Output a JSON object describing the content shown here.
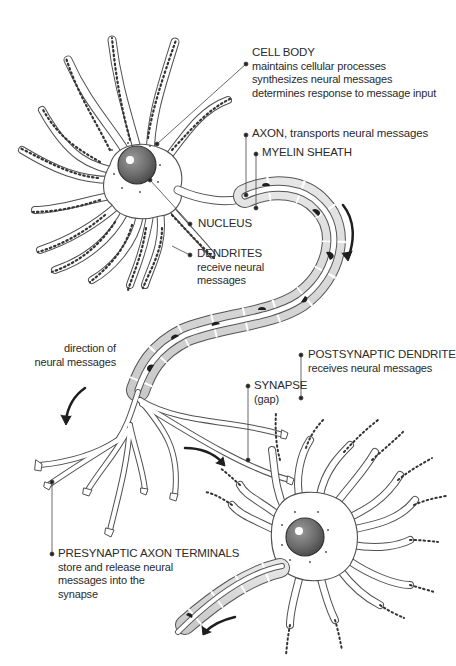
{
  "diagram": {
    "colors": {
      "outline": "#4a4a4a",
      "cell_fill": "#ffffff",
      "myelin_fill": "#d6d6d6",
      "nucleus_fill": "#6e6e6e",
      "spine_dots": "#333333",
      "arrow": "#1e1e1e",
      "text": "#2a2a2a"
    },
    "labels": {
      "cell_body": {
        "title": "CELL BODY",
        "lines": [
          "maintains cellular processes",
          "synthesizes neural messages",
          "determines response to message input"
        ]
      },
      "axon": {
        "title": "AXON, transports neural messages"
      },
      "myelin_sheath": {
        "title": "MYELIN SHEATH"
      },
      "nucleus": {
        "title": "NUCLEUS"
      },
      "dendrites": {
        "title": "DENDRITES",
        "lines": [
          "receive neural",
          "messages"
        ]
      },
      "direction": {
        "lines": [
          "direction of",
          "neural messages"
        ]
      },
      "postsynaptic_dendrite": {
        "title": "POSTSYNAPTIC DENDRITE",
        "lines": [
          "receives neural messages"
        ]
      },
      "synapse": {
        "title": "SYNAPSE",
        "lines": [
          "(gap)"
        ]
      },
      "presynaptic_terminals": {
        "title": "PRESYNAPTIC AXON TERMINALS",
        "lines": [
          "store and release neural",
          "messages into the",
          "synapse"
        ]
      }
    }
  }
}
